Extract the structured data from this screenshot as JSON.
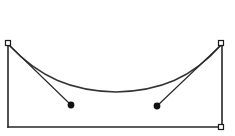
{
  "canvas": {
    "width": 235,
    "height": 136,
    "background_color": "#ffffff"
  },
  "figure": {
    "stroke_color": "#262626",
    "curve_color": "#333333",
    "handle_fill": "#ffffff",
    "handle_stroke": "#1a1a1a",
    "dot_color": "#111111"
  },
  "frame": {
    "name": "bounding-rectangle",
    "left_x": 8,
    "right_x": 222,
    "top_y": 43,
    "bottom_y": 127,
    "stroke_width": 1.6,
    "edges": [
      {
        "name": "left-edge",
        "x1": 8,
        "y1": 43,
        "x2": 8,
        "y2": 127
      },
      {
        "name": "right-edge",
        "x1": 222,
        "y1": 43,
        "x2": 222,
        "y2": 127
      },
      {
        "name": "bottom-edge",
        "x1": 8,
        "y1": 127,
        "x2": 222,
        "y2": 127
      }
    ]
  },
  "curve": {
    "name": "catenary-curve",
    "stroke_width": 1.5,
    "start": {
      "x": 9,
      "y": 44
    },
    "end": {
      "x": 221,
      "y": 44
    },
    "lowest_point": {
      "x": 116,
      "y": 92
    },
    "sag": 48,
    "path": "M 9 45 C 40 78, 72 91, 116 92 C 160 91, 192 78, 221 45"
  },
  "chords": [
    {
      "name": "left-chord",
      "from": {
        "x": 9,
        "y": 45
      },
      "to": {
        "x": 71,
        "y": 105
      },
      "stroke_width": 1.1
    },
    {
      "name": "right-chord",
      "from": {
        "x": 221,
        "y": 45
      },
      "to": {
        "x": 157,
        "y": 106
      },
      "stroke_width": 1.1
    }
  ],
  "dots": [
    {
      "name": "left-node-dot",
      "x": 71,
      "y": 105,
      "r": 3.4
    },
    {
      "name": "right-node-dot",
      "x": 157,
      "y": 106,
      "r": 3.4
    }
  ],
  "handles": [
    {
      "name": "top-left-handle",
      "x": 8,
      "y": 43,
      "size": 5
    },
    {
      "name": "top-right-handle",
      "x": 221,
      "y": 43,
      "size": 5
    },
    {
      "name": "bottom-right-handle",
      "x": 221,
      "y": 127,
      "size": 5
    }
  ]
}
